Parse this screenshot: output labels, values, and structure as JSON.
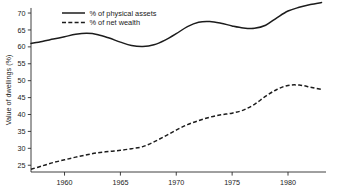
{
  "chart_data": {
    "type": "line",
    "title": "",
    "subtitle": "",
    "xlabel": "",
    "ylabel": "Value of dwellings (%)",
    "xlim": [
      1957,
      1983.4
    ],
    "ylim": [
      23,
      71.5
    ],
    "grid": false,
    "legend_position": "top-left-inside",
    "x_ticks": [
      1960,
      1965,
      1970,
      1975,
      1980
    ],
    "x_tick_labels": [
      "1960",
      "1965",
      "1970",
      "1975",
      "1980"
    ],
    "y_ticks": [
      25,
      30,
      35,
      40,
      45,
      50,
      55,
      60,
      65,
      70
    ],
    "y_tick_labels": [
      "25",
      "30",
      "35",
      "40",
      "45",
      "50",
      "55",
      "60",
      "65",
      "70"
    ],
    "x": [
      1957,
      1958,
      1959,
      1960,
      1961,
      1962,
      1963,
      1964,
      1965,
      1966,
      1967,
      1968,
      1969,
      1970,
      1971,
      1972,
      1973,
      1974,
      1975,
      1976,
      1977,
      1978,
      1979,
      1980,
      1981,
      1982,
      1983
    ],
    "series": [
      {
        "name": "% of physical assets",
        "style": "solid",
        "color": "#1c1c1c",
        "values": [
          61.0,
          61.6,
          62.3,
          63.0,
          63.7,
          64.0,
          63.6,
          62.6,
          61.4,
          60.4,
          60.1,
          60.6,
          62.0,
          63.9,
          66.0,
          67.3,
          67.5,
          67.0,
          66.2,
          65.6,
          65.5,
          66.4,
          68.6,
          70.6,
          71.7,
          72.5,
          73.1
        ]
      },
      {
        "name": "% of net wealth",
        "style": "dashed",
        "color": "#1c1c1c",
        "values": [
          23.8,
          24.8,
          25.8,
          26.6,
          27.4,
          28.1,
          28.7,
          29.1,
          29.4,
          29.9,
          30.5,
          31.9,
          33.6,
          35.4,
          37.0,
          38.2,
          39.2,
          39.9,
          40.4,
          41.3,
          43.0,
          45.4,
          47.4,
          48.6,
          48.7,
          48.1,
          47.4
        ]
      }
    ]
  },
  "legend": {
    "entries": [
      {
        "label": "% of physical assets",
        "style": "solid"
      },
      {
        "label": "% of net wealth",
        "style": "dashed"
      }
    ]
  }
}
